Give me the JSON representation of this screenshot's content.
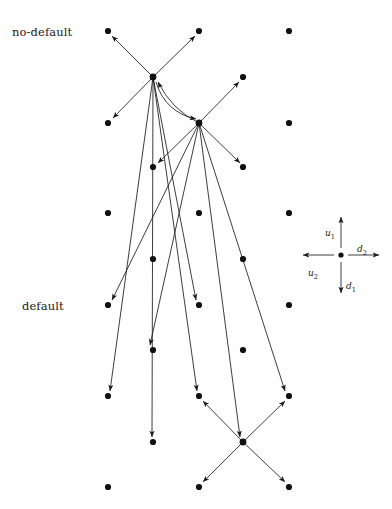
{
  "figure": {
    "width": 392,
    "height": 509,
    "background": "#ffffff",
    "ink_color": "#1a1a1a",
    "dot_radius": 3.1,
    "dot_color": "#111111"
  },
  "row_labels": [
    {
      "id": "no-default",
      "text": "no-default",
      "x": 12,
      "y": 32
    },
    {
      "id": "default",
      "text": "default",
      "x": 22,
      "y": 306
    }
  ],
  "legend": {
    "origin": {
      "x": 341,
      "y": 255
    },
    "arm": 38,
    "dot_radius": 2.6,
    "arrows": [
      {
        "id": "u1",
        "label": "u",
        "subscript": "1",
        "direction": "up",
        "label_x": 325,
        "label_y": 228
      },
      {
        "id": "d1",
        "label": "d",
        "subscript": "1",
        "direction": "down",
        "label_x": 346,
        "label_y": 281
      },
      {
        "id": "u2",
        "label": "u",
        "subscript": "2",
        "direction": "left",
        "label_x": 308,
        "label_y": 268
      },
      {
        "id": "d2",
        "label": "d",
        "subscript": "2",
        "direction": "right",
        "label_x": 357,
        "label_y": 244
      }
    ]
  },
  "lattice": {
    "description": "Staggered lattice of filled dots in two interleaved column families",
    "columns_main": [
      108,
      199,
      289
    ],
    "columns_offset": [
      153,
      243
    ],
    "rows_main": [
      31,
      213,
      305,
      396,
      487
    ],
    "rows_offset": [
      77,
      167,
      259,
      350,
      442
    ],
    "rows_main_extra": [
      123
    ],
    "nodes": [
      {
        "id": "n-0-0",
        "x": 108,
        "y": 31
      },
      {
        "id": "n-0-1",
        "x": 199,
        "y": 31
      },
      {
        "id": "n-0-2",
        "x": 289,
        "y": 31
      },
      {
        "id": "n-1-0",
        "x": 153,
        "y": 77
      },
      {
        "id": "n-1-1",
        "x": 243,
        "y": 77
      },
      {
        "id": "n-2-0",
        "x": 108,
        "y": 123
      },
      {
        "id": "n-2-1",
        "x": 199,
        "y": 123
      },
      {
        "id": "n-2-2",
        "x": 289,
        "y": 123
      },
      {
        "id": "n-3-0",
        "x": 153,
        "y": 167
      },
      {
        "id": "n-3-1",
        "x": 243,
        "y": 167
      },
      {
        "id": "n-4-0",
        "x": 108,
        "y": 213
      },
      {
        "id": "n-4-1",
        "x": 199,
        "y": 213
      },
      {
        "id": "n-4-2",
        "x": 289,
        "y": 213
      },
      {
        "id": "n-5-0",
        "x": 153,
        "y": 259
      },
      {
        "id": "n-5-1",
        "x": 243,
        "y": 259
      },
      {
        "id": "n-6-0",
        "x": 108,
        "y": 305
      },
      {
        "id": "n-6-1",
        "x": 199,
        "y": 305
      },
      {
        "id": "n-6-2",
        "x": 289,
        "y": 305
      },
      {
        "id": "n-7-0",
        "x": 153,
        "y": 350
      },
      {
        "id": "n-7-1",
        "x": 243,
        "y": 350
      },
      {
        "id": "n-8-0",
        "x": 108,
        "y": 396
      },
      {
        "id": "n-8-1",
        "x": 199,
        "y": 396
      },
      {
        "id": "n-8-2",
        "x": 289,
        "y": 396
      },
      {
        "id": "n-9-0",
        "x": 153,
        "y": 442
      },
      {
        "id": "n-9-1",
        "x": 243,
        "y": 442
      },
      {
        "id": "n-10-0",
        "x": 108,
        "y": 487
      },
      {
        "id": "n-10-1",
        "x": 199,
        "y": 487
      },
      {
        "id": "n-10-2",
        "x": 289,
        "y": 487
      }
    ]
  },
  "hubs": [
    {
      "id": "hub-top",
      "x": 153,
      "y": 77
    },
    {
      "id": "hub-middle",
      "x": 199,
      "y": 123
    },
    {
      "id": "hub-bottom",
      "x": 243,
      "y": 442
    }
  ],
  "edges": [
    {
      "id": "e1",
      "from": "hub-top",
      "x1": 153,
      "y1": 77,
      "x2": 112,
      "y2": 36,
      "curve": 0
    },
    {
      "id": "e2",
      "from": "hub-top",
      "x1": 153,
      "y1": 77,
      "x2": 195,
      "y2": 36,
      "curve": 0
    },
    {
      "id": "e3",
      "from": "hub-top",
      "x1": 153,
      "y1": 77,
      "x2": 113,
      "y2": 118,
      "curve": 0
    },
    {
      "id": "e4",
      "from": "hub-top",
      "x1": 153,
      "y1": 77,
      "x2": 152,
      "y2": 437,
      "curve": 0
    },
    {
      "id": "e5",
      "from": "hub-top",
      "x1": 153,
      "y1": 77,
      "x2": 110,
      "y2": 391,
      "curve": 0
    },
    {
      "id": "e6",
      "from": "hub-top",
      "x1": 153,
      "y1": 77,
      "x2": 196,
      "y2": 300,
      "curve": 0
    },
    {
      "id": "e7",
      "from": "hub-top",
      "x1": 153,
      "y1": 77,
      "x2": 197,
      "y2": 391,
      "curve": 0
    },
    {
      "id": "e8",
      "from": "hub-top",
      "x1": 156,
      "y1": 82,
      "x2": 196,
      "y2": 119,
      "curve": 16
    },
    {
      "id": "e9",
      "from": "hub-middle",
      "x1": 199,
      "y1": 123,
      "x2": 158,
      "y2": 82,
      "curve": -10
    },
    {
      "id": "e10",
      "from": "hub-middle",
      "x1": 199,
      "y1": 123,
      "x2": 239,
      "y2": 82,
      "curve": 0
    },
    {
      "id": "e11",
      "from": "hub-middle",
      "x1": 199,
      "y1": 123,
      "x2": 240,
      "y2": 163,
      "curve": 0
    },
    {
      "id": "e12",
      "from": "hub-middle",
      "x1": 199,
      "y1": 123,
      "x2": 158,
      "y2": 163,
      "curve": 0
    },
    {
      "id": "e13",
      "from": "hub-middle",
      "x1": 199,
      "y1": 123,
      "x2": 112,
      "y2": 300,
      "curve": 0
    },
    {
      "id": "e14",
      "from": "hub-middle",
      "x1": 199,
      "y1": 123,
      "x2": 150,
      "y2": 345,
      "curve": 0
    },
    {
      "id": "e15",
      "from": "hub-middle",
      "x1": 199,
      "y1": 123,
      "x2": 240,
      "y2": 437,
      "curve": 0
    },
    {
      "id": "e16",
      "from": "hub-middle",
      "x1": 199,
      "y1": 123,
      "x2": 285,
      "y2": 391,
      "curve": 0
    },
    {
      "id": "e17",
      "from": "hub-bottom",
      "x1": 243,
      "y1": 442,
      "x2": 203,
      "y2": 401,
      "curve": 0
    },
    {
      "id": "e18",
      "from": "hub-bottom",
      "x1": 243,
      "y1": 442,
      "x2": 285,
      "y2": 401,
      "curve": 0
    },
    {
      "id": "e19",
      "from": "hub-bottom",
      "x1": 243,
      "y1": 442,
      "x2": 203,
      "y2": 482,
      "curve": 0
    },
    {
      "id": "e20",
      "from": "hub-bottom",
      "x1": 243,
      "y1": 442,
      "x2": 285,
      "y2": 482,
      "curve": 0
    }
  ]
}
